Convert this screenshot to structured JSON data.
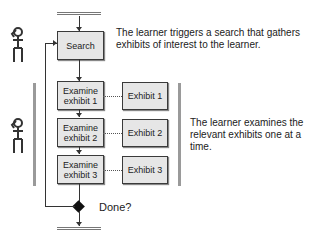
{
  "diagram": {
    "steps": {
      "search": "Search",
      "examine": [
        "Examine\nexhibit 1",
        "Examine\nexhibit 2",
        "Examine\nexhibit 3"
      ],
      "exhibits": [
        "Exhibit 1",
        "Exhibit 2",
        "Exhibit 3"
      ],
      "decision": "Done?"
    },
    "notes": {
      "search_note": "The learner triggers a search that gathers exhibits of interest to the learner.",
      "examine_note": "The learner examines the relevant exhibits one at a time."
    },
    "icons": [
      "thinking-figure-icon",
      "thinking-figure-icon"
    ],
    "colors": {
      "box_fill": "#e6e6e6",
      "box_border": "#3a3a3a",
      "bracket": "#9a9a9a",
      "line": "#333333"
    }
  }
}
